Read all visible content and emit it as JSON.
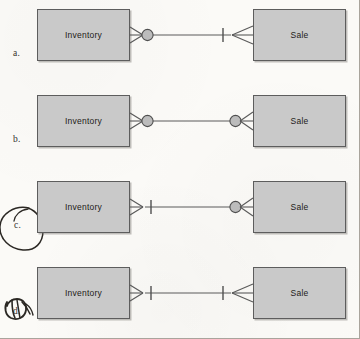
{
  "page": {
    "background_color": "#fbfaf7",
    "frame_color": "#a9a49c",
    "entity_fill": "#c9c9c9",
    "entity_stroke": "#5d5d5d",
    "line_color": "#5a5a5a",
    "ink_color": "#2b2824"
  },
  "diagram": {
    "type": "er-crowsfoot-cardinality-variants",
    "entity_left_label": "Inventory",
    "entity_right_label": "Sale",
    "rows": [
      {
        "id": "a",
        "label": "a.",
        "left_entity": "Inventory",
        "right_entity": "Sale",
        "left_cardinality": "zero-or-many",
        "left_symbols": [
          "crowsfoot",
          "circle"
        ],
        "right_cardinality": "one-or-many",
        "right_symbols": [
          "bar",
          "crowsfoot"
        ],
        "annotated": false,
        "annotation": ""
      },
      {
        "id": "b",
        "label": "b.",
        "left_entity": "Inventory",
        "right_entity": "Sale",
        "left_cardinality": "zero-or-many",
        "left_symbols": [
          "crowsfoot",
          "circle"
        ],
        "right_cardinality": "zero-or-many",
        "right_symbols": [
          "circle",
          "crowsfoot"
        ],
        "annotated": false,
        "annotation": ""
      },
      {
        "id": "c",
        "label": "c.",
        "left_entity": "Inventory",
        "right_entity": "Sale",
        "left_cardinality": "one-or-many",
        "left_symbols": [
          "crowsfoot",
          "bar"
        ],
        "right_cardinality": "zero-or-many",
        "right_symbols": [
          "circle",
          "crowsfoot"
        ],
        "annotated": true,
        "annotation": "hand-drawn-oval"
      },
      {
        "id": "d",
        "label": "d.",
        "left_entity": "Inventory",
        "right_entity": "Sale",
        "left_cardinality": "one-or-many",
        "left_symbols": [
          "crowsfoot",
          "bar"
        ],
        "right_cardinality": "one-or-many",
        "right_symbols": [
          "bar",
          "crowsfoot"
        ],
        "annotated": true,
        "annotation": "hand-drawn-scribble"
      }
    ]
  }
}
